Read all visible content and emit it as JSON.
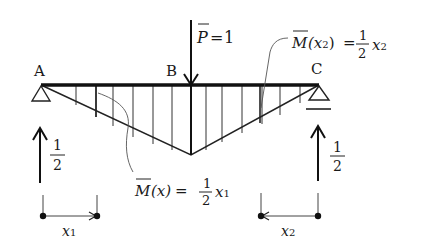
{
  "diagram": {
    "type": "beam-moment-diagram",
    "nodes": [
      {
        "id": "A",
        "label": "A"
      },
      {
        "id": "B",
        "label": "B"
      },
      {
        "id": "C",
        "label": "C"
      }
    ],
    "load": {
      "symbol": "P",
      "equals": "=",
      "value": "1"
    },
    "reactions": {
      "left": {
        "num": "1",
        "den": "2"
      },
      "right": {
        "num": "1",
        "den": "2"
      }
    },
    "moment_left": {
      "symbol": "M",
      "arg": "(x)",
      "equals": "=",
      "num": "1",
      "den": "2",
      "var": "x",
      "sub": "1"
    },
    "moment_right": {
      "symbol": "M",
      "arg_open": "(x",
      "arg_sub": "2",
      "arg_close": ")",
      "equals": "=",
      "num": "1",
      "den": "2",
      "var": "x",
      "sub": "2"
    },
    "dimensions": {
      "x1": {
        "var": "x",
        "sub": "1"
      },
      "x2": {
        "var": "x",
        "sub": "2"
      }
    }
  }
}
